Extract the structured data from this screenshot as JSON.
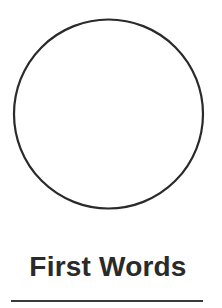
{
  "page": {
    "title": "First Words",
    "background": "#ffffff",
    "ink_color": "#2a2a2a"
  },
  "illustration": {
    "shape": "circle",
    "fill": "#ffffff",
    "stroke": "#2a2a2a"
  },
  "footer": {
    "rule_color": "#3a3a3a"
  }
}
